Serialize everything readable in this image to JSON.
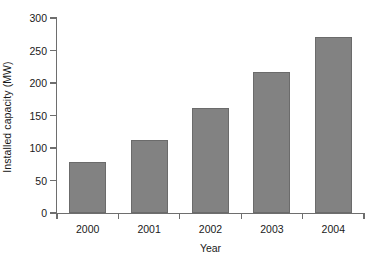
{
  "chart_data": {
    "type": "bar",
    "title": "",
    "subtitle": "",
    "xlabel": "Year",
    "ylabel": "Installed capacity (MW)",
    "categories": [
      "2000",
      "2001",
      "2002",
      "2003",
      "2004"
    ],
    "values": [
      78,
      112,
      162,
      217,
      271
    ],
    "series": [
      {
        "name": "Installed capacity",
        "values": [
          78,
          112,
          162,
          217,
          271
        ]
      }
    ],
    "ylim": [
      0,
      300
    ],
    "y_ticks": [
      0,
      50,
      100,
      150,
      200,
      250,
      300
    ],
    "y_tick_labels": [
      "0",
      "50",
      "100",
      "150",
      "200",
      "250",
      "300"
    ],
    "grid": false,
    "legend": false,
    "legend_position": "none",
    "annotations": [],
    "colors": {
      "bar_fill": "#828282",
      "bar_border": "#6b6b6b",
      "axis": "#6e6e6e",
      "text": "#1a1a1a",
      "background": "#ffffff"
    }
  }
}
